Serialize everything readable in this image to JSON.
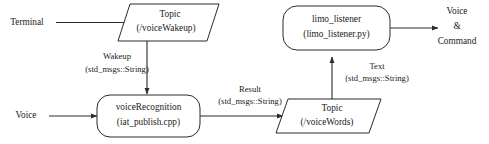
{
  "diagram": {
    "background_color": "#ffffff",
    "stroke_color": "#2b2b2b",
    "text_color": "#1a1a1a",
    "nodes": {
      "topic_wakeup": {
        "shape": "parallelogram",
        "line1": "Topic",
        "line2": "(/voiceWakeup)"
      },
      "voice_recognition": {
        "shape": "rounded-rectangle",
        "line1": "voiceRecognition",
        "line2": "(iat_publish.cpp)"
      },
      "topic_words": {
        "shape": "parallelogram",
        "line1": "Topic",
        "line2": "(/voiceWords)"
      },
      "limo_listener": {
        "shape": "rounded-rectangle",
        "line1": "limo_listener",
        "line2": "(limo_listener.py)"
      }
    },
    "external": {
      "terminal": "Terminal",
      "voice_in": "Voice",
      "output_line1": "Voice",
      "output_line2": "&",
      "output_line3": "Command"
    },
    "edges": {
      "terminal_to_wakeup": {
        "from": "Terminal",
        "to": "Topic (/voiceWakeup)",
        "label_line1": "",
        "label_line2": ""
      },
      "wakeup_to_recognition": {
        "from": "Topic (/voiceWakeup)",
        "to": "voiceRecognition",
        "label_line1": "Wakeup",
        "label_line2": "(std_msgs::String)"
      },
      "voice_to_recognition": {
        "from": "Voice",
        "to": "voiceRecognition",
        "label_line1": "",
        "label_line2": ""
      },
      "recognition_to_words": {
        "from": "voiceRecognition",
        "to": "Topic (/voiceWords)",
        "label_line1": "Result",
        "label_line2": "(std_msgs::String)"
      },
      "words_to_listener": {
        "from": "Topic (/voiceWords)",
        "to": "limo_listener",
        "label_line1": "Text",
        "label_line2": "(std_msgs::String)"
      },
      "listener_to_output": {
        "from": "limo_listener",
        "to": "Voice & Command",
        "label_line1": "",
        "label_line2": ""
      }
    }
  }
}
